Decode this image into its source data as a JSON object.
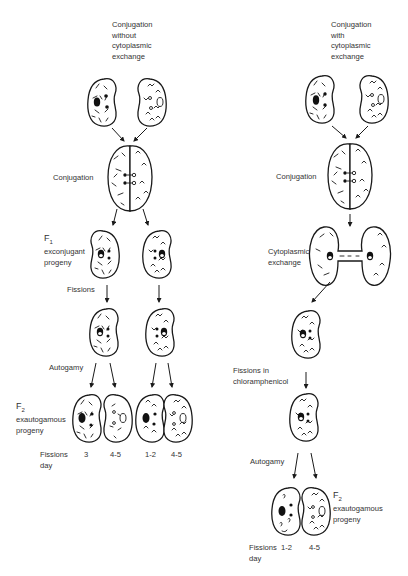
{
  "left_panel": {
    "title_lines": [
      "Conjugation",
      "without",
      "cytoplasmic",
      "exchange"
    ],
    "conjugation_label": "Conjugation",
    "f1_label": "F",
    "f1_sub": "1",
    "f1_desc_lines": [
      "exconjugant",
      "progeny"
    ],
    "fissions_label": "Fissions",
    "autogamy_label": "Autogamy",
    "f2_label": "F",
    "f2_sub": "2",
    "f2_desc_lines": [
      "exautogamous",
      "progeny"
    ],
    "fissions_day_lines": [
      "Fissions",
      "day"
    ],
    "fission_values": [
      "3",
      "4-5",
      "1-2",
      "4-5"
    ]
  },
  "right_panel": {
    "title_lines": [
      "Conjugation",
      "with",
      "cytoplasmic",
      "exchange"
    ],
    "conjugation_label": "Conjugation",
    "cytoplasmic_exchange_lines": [
      "Cytoplasmic",
      "exchange"
    ],
    "fissions_chloramphenicol_lines": [
      "Fissions in",
      "chloramphenicol"
    ],
    "autogamy_label": "Autogamy",
    "f2_label": "F",
    "f2_sub": "2",
    "f2_desc_lines": [
      "exautogamous",
      "progeny"
    ],
    "fissions_day_lines": [
      "Fissions",
      "day"
    ],
    "fission_values": [
      "1-2",
      "4-5"
    ]
  },
  "icons": {
    "cell": "paramecium-cell-icon",
    "arrow": "arrow-down-icon"
  },
  "colors": {
    "ink": "#1a1a1a",
    "text": "#333333",
    "background": "#ffffff"
  }
}
